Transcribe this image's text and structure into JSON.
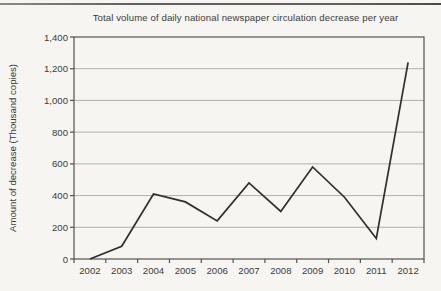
{
  "page": {
    "background": "#f6f5f2",
    "top_rule_color": "#5f5f5f"
  },
  "chart_data": {
    "type": "line",
    "title": "Total volume of daily national newspaper circulation decrease per year",
    "xlabel": "",
    "ylabel": "Amount of decrease (Thousand copies)",
    "categories": [
      "2002",
      "2003",
      "2004",
      "2005",
      "2006",
      "2007",
      "2008",
      "2009",
      "2010",
      "2011",
      "2012"
    ],
    "values": [
      0,
      80,
      410,
      360,
      240,
      480,
      300,
      580,
      390,
      130,
      1240
    ],
    "series_name": "Amount of decrease",
    "ylim": [
      0,
      1400
    ],
    "ytick_step": 200,
    "ytick_labels": [
      "0",
      "200",
      "400",
      "600",
      "800",
      "1,000",
      "1,200",
      "1,400"
    ],
    "grid": true,
    "legend": "none",
    "line_color": "#2f2f2f",
    "grid_color": "#b3b0ab",
    "axis_color": "#55524c",
    "text_color": "#3b3b3b"
  }
}
